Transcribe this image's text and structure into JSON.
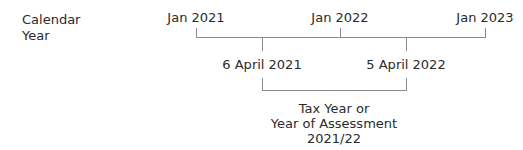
{
  "row_label": {
    "line1": "Calendar",
    "line2": "Year"
  },
  "calendar_ticks": [
    {
      "label": "Jan 2021",
      "x": 196
    },
    {
      "label": "Jan 2022",
      "x": 340
    },
    {
      "label": "Jan 2023",
      "x": 485
    }
  ],
  "tax_ticks": [
    {
      "label": "6 April 2021",
      "x": 262
    },
    {
      "label": "5 April 2022",
      "x": 406
    }
  ],
  "tax_year_label": {
    "line1": "Tax Year or",
    "line2": "Year of Assessment",
    "line3": "2021/22"
  },
  "colors": {
    "line": "#8a8a8a",
    "text": "#2b2b2b"
  }
}
